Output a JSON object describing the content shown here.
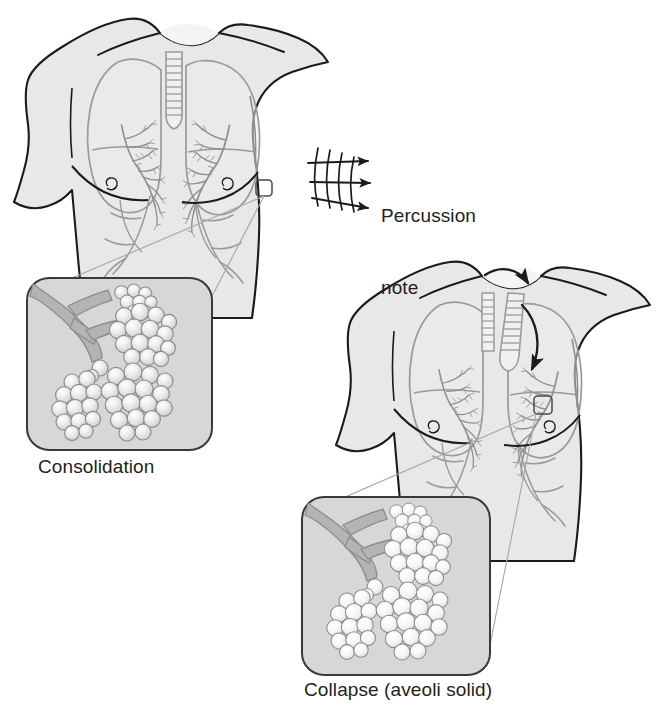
{
  "figure": {
    "background_color": "#ffffff",
    "width": 659,
    "height": 722
  },
  "palette": {
    "skin_fill": "#e8e8e8",
    "skin_fill_light": "#efefef",
    "outline_dark": "#1b1b1b",
    "lung_outline": "#9a9a9a",
    "bronchi": "#8f8f8f",
    "inset_background": "#d7d7d7",
    "inset_border": "#3a3a3a",
    "bronchiole_fill": "#b4b4b4",
    "alveoli_fill": "#e4e4e4",
    "alveoli_fill_pale": "#f0f0f0",
    "alveoli_stroke": "#8c8c8c",
    "leader_line": "#a0a0a0",
    "arrow_color": "#1b1b1b",
    "text_color": "#231f20"
  },
  "labels": {
    "percussion_note": "Percussion\nnote",
    "percussion_note_line1": "Percussion",
    "percussion_note_line2": "note",
    "consolidation": "Consolidation",
    "collapse": "Collapse (aveoli solid)"
  },
  "panels": [
    {
      "id": "torso-consolidation",
      "name": "upper-torso-consolidation",
      "description": "Anterior chest with lungs and bronchial tree, percussion arrows at right lateral chest",
      "caption": "Percussion note",
      "has_percussion_arrows": true,
      "percussion_arrow_count": 3,
      "percussion_arc_count": 4,
      "has_trachea_deviation_arrows": false,
      "callout_marker": {
        "x": 262,
        "y": 190,
        "w": 16,
        "h": 16
      }
    },
    {
      "id": "torso-collapse",
      "name": "lower-torso-collapse",
      "description": "Anterior chest with lungs, trachea deviated toward collapsed side, curved arrows",
      "caption": "",
      "has_percussion_arrows": false,
      "has_trachea_deviation_arrows": true,
      "trachea_deviation_arrow_count": 2,
      "callout_marker": {
        "x": 534,
        "y": 396,
        "w": 18,
        "h": 18
      }
    }
  ],
  "insets": [
    {
      "id": "inset-consolidation",
      "name": "alveoli-inset-consolidation",
      "caption": "Consolidation",
      "description": "Bronchiole with grape-like clusters of alveoli, alveoli appear solid and shaded",
      "alveoli_cluster_count": 4,
      "box": {
        "x": 27,
        "y": 278,
        "w": 185,
        "h": 172
      },
      "caption_position": "below"
    },
    {
      "id": "inset-collapse",
      "name": "alveoli-inset-collapse",
      "caption": "Collapse (aveoli solid)",
      "description": "Bronchiole with clusters of alveoli, pale and airless indicating collapse",
      "alveoli_cluster_count": 4,
      "box": {
        "x": 302,
        "y": 497,
        "w": 188,
        "h": 178
      },
      "caption_position": "below"
    }
  ],
  "annotations": {
    "percussion_arrows": [
      {
        "id": "arrow-1",
        "direction": "right",
        "label": "percussion sound wave 1"
      },
      {
        "id": "arrow-2",
        "direction": "right",
        "label": "percussion sound wave 2"
      },
      {
        "id": "arrow-3",
        "direction": "right-down",
        "label": "percussion sound wave 3"
      }
    ],
    "tracheal_arrows": [
      {
        "id": "trachea-arrow-upper",
        "direction": "clockwise",
        "label": "trachea deviates toward collapse"
      },
      {
        "id": "trachea-arrow-lower",
        "direction": "clockwise-down",
        "label": "mediastinal shift"
      }
    ],
    "leader_lines": [
      {
        "id": "leader-consolidation-a",
        "from": "callout-marker-1",
        "to": "inset-consolidation-top-right"
      },
      {
        "id": "leader-consolidation-b",
        "from": "callout-marker-1",
        "to": "inset-consolidation-top-left"
      },
      {
        "id": "leader-collapse-a",
        "from": "callout-marker-2",
        "to": "inset-collapse-top-right"
      },
      {
        "id": "leader-collapse-b",
        "from": "callout-marker-2",
        "to": "inset-collapse-top-left"
      }
    ]
  }
}
